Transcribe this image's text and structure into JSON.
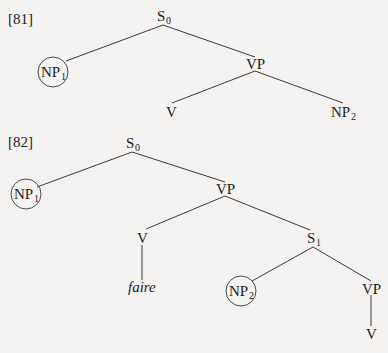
{
  "trees": [
    {
      "label": "[81]",
      "nodes": {
        "root": {
          "main": "S",
          "sub": "0"
        },
        "np1": {
          "main": "NP",
          "sub": "1",
          "circled": true
        },
        "vp": {
          "main": "VP",
          "sub": ""
        },
        "v": {
          "main": "V",
          "sub": ""
        },
        "np2": {
          "main": "NP",
          "sub": "2"
        }
      },
      "edges": [
        [
          "root",
          "np1"
        ],
        [
          "root",
          "vp"
        ],
        [
          "vp",
          "v"
        ],
        [
          "vp",
          "np2"
        ]
      ]
    },
    {
      "label": "[82]",
      "nodes": {
        "root": {
          "main": "S",
          "sub": "0"
        },
        "np1": {
          "main": "NP",
          "sub": "1",
          "circled": true
        },
        "vp": {
          "main": "VP",
          "sub": ""
        },
        "v": {
          "main": "V",
          "sub": ""
        },
        "faire": {
          "main": "faire",
          "sub": "",
          "italic": true
        },
        "s1": {
          "main": "S",
          "sub": "1"
        },
        "np2": {
          "main": "NP",
          "sub": "2",
          "circled": true
        },
        "vp2": {
          "main": "VP",
          "sub": ""
        },
        "v2": {
          "main": "V",
          "sub": ""
        }
      },
      "edges": [
        [
          "root",
          "np1"
        ],
        [
          "root",
          "vp"
        ],
        [
          "vp",
          "v"
        ],
        [
          "vp",
          "s1"
        ],
        [
          "v",
          "faire"
        ],
        [
          "s1",
          "np2"
        ],
        [
          "s1",
          "vp2"
        ],
        [
          "vp2",
          "v2"
        ]
      ]
    }
  ]
}
